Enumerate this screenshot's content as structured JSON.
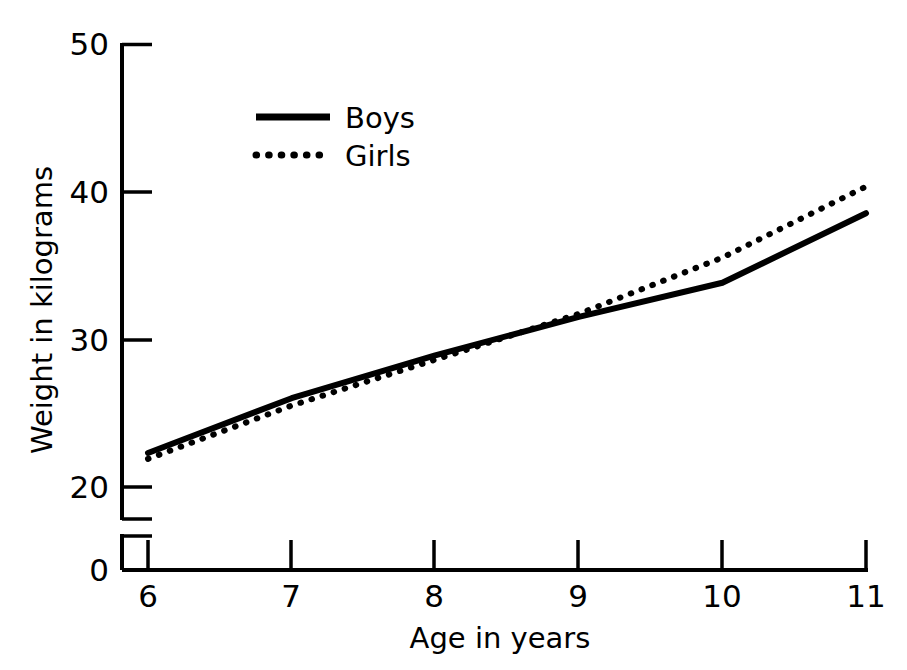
{
  "chart_data": {
    "type": "line",
    "title": "",
    "xlabel": "Age in years",
    "ylabel": "Weight in kilograms",
    "x": [
      6,
      7,
      8,
      9,
      10,
      11
    ],
    "xtick_labels": [
      "6",
      "7",
      "8",
      "9",
      "10",
      "11"
    ],
    "ytick_labels": [
      "20",
      "30",
      "40",
      "50"
    ],
    "yticks": [
      20,
      30,
      40,
      50
    ],
    "y_origin_label": "0",
    "xlim": [
      6,
      11
    ],
    "ylim": [
      20,
      50
    ],
    "grid": false,
    "axis_break": true,
    "legend_position": "upper-left-inside",
    "series": [
      {
        "name": "Boys",
        "style": "solid",
        "color": "#000000",
        "values": [
          22.3,
          26.0,
          28.9,
          31.5,
          33.8,
          38.5
        ]
      },
      {
        "name": "Girls",
        "style": "dotted",
        "color": "#000000",
        "values": [
          21.9,
          25.5,
          28.6,
          31.7,
          35.5,
          40.3
        ]
      }
    ]
  },
  "axis": {
    "y_label": "Weight in kilograms",
    "x_label": "Age in years",
    "y_ticks": [
      "50",
      "40",
      "30",
      "20"
    ],
    "y_zero": "0",
    "x_ticks": [
      "6",
      "7",
      "8",
      "9",
      "10",
      "11"
    ]
  },
  "legend": {
    "entries": [
      {
        "label": "Boys",
        "marker": "solid-line-swatch"
      },
      {
        "label": "Girls",
        "marker": "dotted-line-swatch"
      }
    ]
  }
}
